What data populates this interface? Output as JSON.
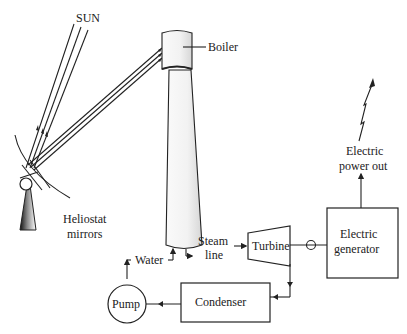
{
  "labels": {
    "sun": "SUN",
    "boiler": "Boiler",
    "heliostat_line1": "Heliostat",
    "heliostat_line2": "mirrors",
    "water": "Water",
    "steam_line1": "Steam",
    "steam_line2": "line",
    "turbine": "Turbine",
    "generator_line1": "Electric",
    "generator_line2": "generator",
    "power_line1": "Electric",
    "power_line2": "power out",
    "condenser": "Condenser",
    "pump": "Pump"
  },
  "components": [
    {
      "id": "sun",
      "label": "SUN"
    },
    {
      "id": "heliostat",
      "label": "Heliostat mirrors"
    },
    {
      "id": "boiler",
      "label": "Boiler"
    },
    {
      "id": "tower",
      "label": ""
    },
    {
      "id": "turbine",
      "label": "Turbine"
    },
    {
      "id": "generator",
      "label": "Electric generator"
    },
    {
      "id": "condenser",
      "label": "Condenser"
    },
    {
      "id": "pump",
      "label": "Pump"
    }
  ],
  "flows": [
    {
      "from": "sun",
      "to": "heliostat",
      "type": "sunlight"
    },
    {
      "from": "heliostat",
      "to": "boiler",
      "type": "reflected light"
    },
    {
      "from": "tower",
      "to": "turbine",
      "label": "Steam line"
    },
    {
      "from": "turbine",
      "to": "generator",
      "type": "shaft"
    },
    {
      "from": "generator",
      "to": "output",
      "label": "Electric power out"
    },
    {
      "from": "turbine",
      "to": "condenser"
    },
    {
      "from": "condenser",
      "to": "pump"
    },
    {
      "from": "pump",
      "to": "tower",
      "label": "Water"
    }
  ]
}
